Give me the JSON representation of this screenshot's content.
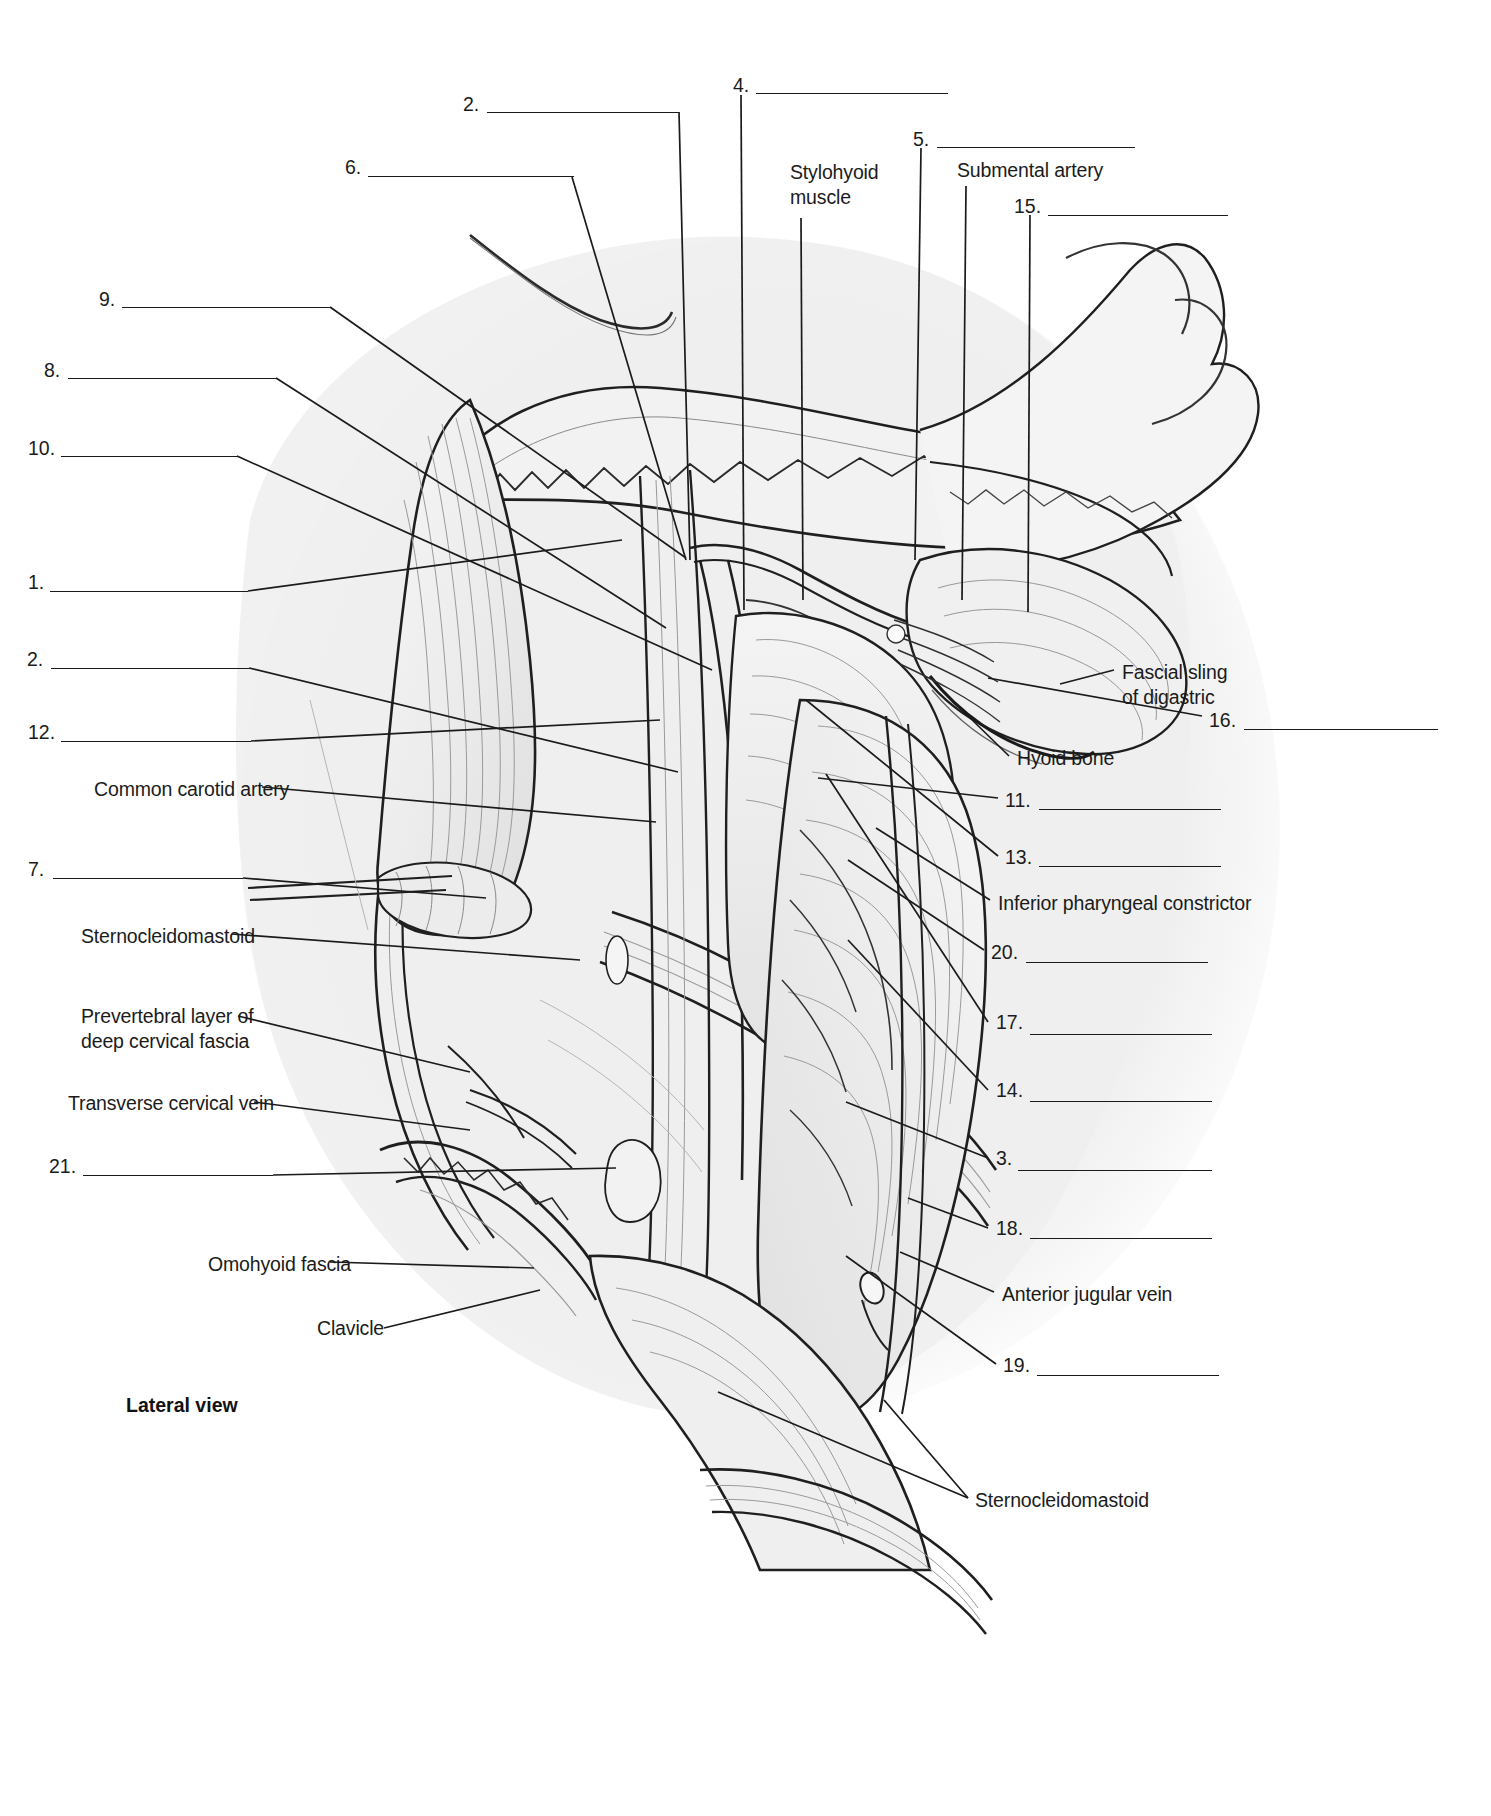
{
  "figure": {
    "view_caption": "Lateral view",
    "type": "anatomy-labeling-worksheet"
  },
  "numbered_blanks": [
    {
      "id": "n2top",
      "number": "2.",
      "x": 463,
      "y": 92,
      "line_x": 487,
      "line_y": 112,
      "line_w": 192
    },
    {
      "id": "n4",
      "number": "4.",
      "x": 733,
      "y": 73,
      "line_x": 756,
      "line_y": 93,
      "line_w": 192
    },
    {
      "id": "n6",
      "number": "6.",
      "x": 345,
      "y": 155,
      "line_x": 368,
      "line_y": 176,
      "line_w": 206
    },
    {
      "id": "n5",
      "number": "5.",
      "x": 913,
      "y": 127,
      "line_x": 937,
      "line_y": 147,
      "line_w": 198
    },
    {
      "id": "n15",
      "number": "15.",
      "x": 1014,
      "y": 194,
      "line_x": 1048,
      "line_y": 215,
      "line_w": 180
    },
    {
      "id": "n9",
      "number": "9.",
      "x": 99,
      "y": 287,
      "line_x": 122,
      "line_y": 307,
      "line_w": 208
    },
    {
      "id": "n8",
      "number": "8.",
      "x": 44,
      "y": 358,
      "line_x": 68,
      "line_y": 378,
      "line_w": 208
    },
    {
      "id": "n10",
      "number": "10.",
      "x": 28,
      "y": 436,
      "line_x": 61,
      "line_y": 456,
      "line_w": 176
    },
    {
      "id": "n1",
      "number": "1.",
      "x": 28,
      "y": 570,
      "line_x": 50,
      "line_y": 591,
      "line_w": 198
    },
    {
      "id": "n2",
      "number": "2.",
      "x": 27,
      "y": 647,
      "line_x": 51,
      "line_y": 668,
      "line_w": 198
    },
    {
      "id": "n12",
      "number": "12.",
      "x": 28,
      "y": 720,
      "line_x": 61,
      "line_y": 741,
      "line_w": 190
    },
    {
      "id": "n7",
      "number": "7.",
      "x": 28,
      "y": 857,
      "line_x": 53,
      "line_y": 878,
      "line_w": 190
    },
    {
      "id": "n21",
      "number": "21.",
      "x": 49,
      "y": 1154,
      "line_x": 83,
      "line_y": 1175,
      "line_w": 190
    },
    {
      "id": "n16",
      "number": "16.",
      "x": 1209,
      "y": 708,
      "line_x": 1244,
      "line_y": 729,
      "line_w": 194
    },
    {
      "id": "n11",
      "number": "11.",
      "x": 1005,
      "y": 788,
      "line_x": 1039,
      "line_y": 809,
      "line_w": 182
    },
    {
      "id": "n13",
      "number": "13.",
      "x": 1005,
      "y": 845,
      "line_x": 1039,
      "line_y": 866,
      "line_w": 182
    },
    {
      "id": "n20",
      "number": "20.",
      "x": 991,
      "y": 940,
      "line_x": 1026,
      "line_y": 962,
      "line_w": 182
    },
    {
      "id": "n17",
      "number": "17.",
      "x": 996,
      "y": 1010,
      "line_x": 1030,
      "line_y": 1034,
      "line_w": 182
    },
    {
      "id": "n14",
      "number": "14.",
      "x": 996,
      "y": 1078,
      "line_x": 1030,
      "line_y": 1101,
      "line_w": 182
    },
    {
      "id": "n3",
      "number": "3.",
      "x": 996,
      "y": 1146,
      "line_x": 1018,
      "line_y": 1170,
      "line_w": 194
    },
    {
      "id": "n18",
      "number": "18.",
      "x": 996,
      "y": 1216,
      "line_x": 1030,
      "line_y": 1238,
      "line_w": 182
    },
    {
      "id": "n19",
      "number": "19.",
      "x": 1003,
      "y": 1353,
      "line_x": 1037,
      "line_y": 1375,
      "line_w": 182
    }
  ],
  "named_labels": [
    {
      "id": "stylohyoid",
      "text": "Stylohyoid\nmuscle",
      "x": 790,
      "y": 160,
      "align": "left"
    },
    {
      "id": "submental",
      "text": "Submental artery",
      "x": 957,
      "y": 158,
      "align": "left"
    },
    {
      "id": "fascialsling",
      "text": "Fascial sling\nof digastric",
      "x": 1122,
      "y": 660,
      "align": "left"
    },
    {
      "id": "hyoid",
      "text": "Hyoid bone",
      "x": 1017,
      "y": 746,
      "align": "left"
    },
    {
      "id": "infpharyn",
      "text": "Inferior pharyngeal constrictor",
      "x": 998,
      "y": 891,
      "align": "left"
    },
    {
      "id": "antjugular",
      "text": "Anterior jugular vein",
      "x": 1002,
      "y": 1282,
      "align": "left"
    },
    {
      "id": "scmbottom",
      "text": "Sternocleidomastoid",
      "x": 975,
      "y": 1488,
      "align": "left"
    },
    {
      "id": "commoncar",
      "text": "Common carotid artery",
      "x": 94,
      "y": 777,
      "align": "left"
    },
    {
      "id": "scmleft",
      "text": "Sternocleidomastoid",
      "x": 81,
      "y": 924,
      "align": "left"
    },
    {
      "id": "prevertebral",
      "text": "Prevertebral layer of\ndeep cervical fascia",
      "x": 81,
      "y": 1004,
      "align": "left"
    },
    {
      "id": "transcerv",
      "text": "Transverse cervical vein",
      "x": 68,
      "y": 1091,
      "align": "left"
    },
    {
      "id": "omohyoid",
      "text": "Omohyoid fascia",
      "x": 208,
      "y": 1252,
      "align": "left"
    },
    {
      "id": "clavicle",
      "text": "Clavicle",
      "x": 317,
      "y": 1316,
      "align": "left"
    }
  ],
  "colors": {
    "ink": "#1b1b1b",
    "paper": "#ffffff",
    "wash": "#eeeeee",
    "line": "#3a3a3a"
  }
}
